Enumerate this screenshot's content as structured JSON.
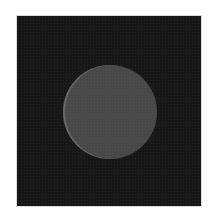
{
  "image": {
    "description": "Dark noisy square field with a centered uniform gray circular disc",
    "colors": {
      "page_background": "#ffffff",
      "field": "#1b1b1b",
      "disc": "#565656"
    },
    "field": {
      "x": 16,
      "y": 15,
      "width": 186,
      "height": 192
    },
    "disc": {
      "center_x": 109,
      "center_y": 111,
      "radius": 47
    }
  }
}
